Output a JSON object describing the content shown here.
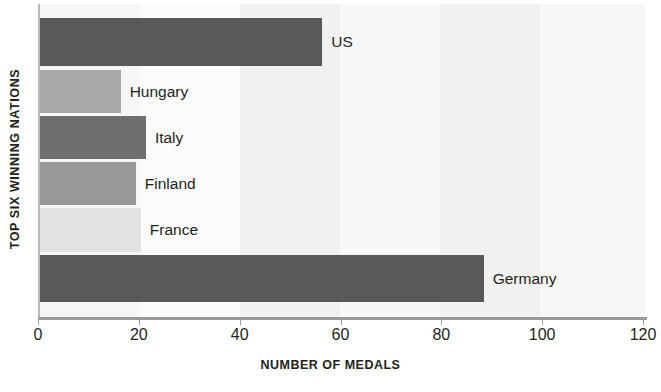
{
  "chart_data": {
    "type": "bar",
    "orientation": "horizontal",
    "title": "",
    "xlabel": "NUMBER OF MEDALS",
    "ylabel": "TOP SIX WINNING NATIONS",
    "categories": [
      "US",
      "Hungary",
      "Italy",
      "Finland",
      "France",
      "Germany"
    ],
    "values": [
      56,
      16,
      21,
      19,
      20,
      88
    ],
    "xlim": [
      0,
      120
    ],
    "xticks": [
      0,
      20,
      40,
      60,
      80,
      100,
      120
    ],
    "xtick_labels": [
      "0",
      "20",
      "40",
      "60",
      "80",
      "100",
      "120"
    ],
    "grid": false,
    "legend": "none",
    "bar_colors": [
      "#595959",
      "#a8a8a8",
      "#6f6f6f",
      "#989898",
      "#e2e2e2",
      "#595959"
    ],
    "plot_background": "#fafafa",
    "band_color": "#f2f2f2",
    "axis_color": "#9a9a9a",
    "text_color": "#231f20"
  },
  "bars": [
    {
      "label": "US",
      "value": 56,
      "color": "#595959"
    },
    {
      "label": "Hungary",
      "value": 16,
      "color": "#a8a8a8"
    },
    {
      "label": "Italy",
      "value": 21,
      "color": "#6f6f6f"
    },
    {
      "label": "Finland",
      "value": 19,
      "color": "#989898"
    },
    {
      "label": "France",
      "value": 20,
      "color": "#e2e2e2"
    },
    {
      "label": "Germany",
      "value": 88,
      "color": "#595959"
    }
  ],
  "axes": {
    "x_title": "NUMBER OF MEDALS",
    "y_title": "TOP SIX WINNING NATIONS",
    "x_ticks": [
      "0",
      "20",
      "40",
      "60",
      "80",
      "100",
      "120"
    ]
  }
}
